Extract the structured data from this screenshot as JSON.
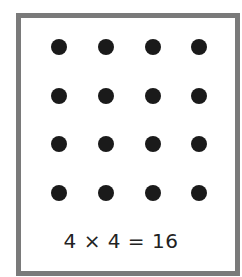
{
  "diagram": {
    "type": "dot-array",
    "rows": 4,
    "columns": 4,
    "total": 16,
    "caption": "4 × 4 = 16",
    "colors": {
      "dot": "#1a1a1a",
      "border": "#7a7a7a",
      "background": "#ffffff"
    }
  }
}
